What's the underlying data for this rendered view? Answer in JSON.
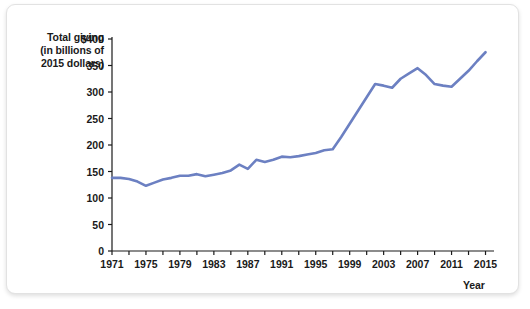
{
  "figure": {
    "y_axis_title_lines": [
      "Total giving",
      "(in billions of",
      "2015 dollars)"
    ],
    "x_axis_title": "Year",
    "line_color": "#6c80c2",
    "axis_color": "#1a1a1a",
    "card_background": "#ffffff"
  },
  "chart_data": {
    "type": "line",
    "title": "",
    "subtitle": "",
    "xlabel": "Year",
    "ylabel": "Total giving (in billions of 2015 dollars)",
    "grid": false,
    "legend": "none",
    "xlim": [
      1971,
      2016
    ],
    "ylim": [
      0,
      400
    ],
    "y_ticks": [
      0,
      50,
      100,
      150,
      200,
      250,
      300,
      350,
      400
    ],
    "y_tick_labels": [
      "0",
      "50",
      "100",
      "150",
      "200",
      "250",
      "300",
      "350",
      "$400"
    ],
    "x_ticks": [
      1971,
      1973,
      1975,
      1977,
      1979,
      1981,
      1983,
      1985,
      1987,
      1989,
      1991,
      1993,
      1995,
      1997,
      1999,
      2001,
      2003,
      2005,
      2007,
      2009,
      2011,
      2013,
      2015
    ],
    "x_tick_labels_shown": [
      "1971",
      "1975",
      "1979",
      "1983",
      "1987",
      "1991",
      "1995",
      "1999",
      "2003",
      "2007",
      "2011",
      "2015"
    ],
    "x": [
      1971,
      1972,
      1973,
      1974,
      1975,
      1976,
      1977,
      1978,
      1979,
      1980,
      1981,
      1982,
      1983,
      1984,
      1985,
      1986,
      1987,
      1988,
      1989,
      1990,
      1991,
      1992,
      1993,
      1994,
      1995,
      1996,
      1997,
      1998,
      1999,
      2000,
      2001,
      2002,
      2003,
      2004,
      2005,
      2006,
      2007,
      2008,
      2009,
      2010,
      2011,
      2012,
      2013,
      2014,
      2015
    ],
    "values": [
      138,
      138,
      136,
      131,
      123,
      129,
      135,
      138,
      142,
      142,
      145,
      141,
      144,
      147,
      152,
      163,
      155,
      172,
      168,
      172,
      178,
      177,
      179,
      182,
      185,
      190,
      192,
      215,
      240,
      265,
      290,
      315,
      312,
      308,
      325,
      335,
      345,
      332,
      315,
      312,
      310,
      325,
      340,
      358,
      375
    ],
    "series": [
      {
        "name": "Total giving",
        "values": [
          138,
          138,
          136,
          131,
          123,
          129,
          135,
          138,
          142,
          142,
          145,
          141,
          144,
          147,
          152,
          163,
          155,
          172,
          168,
          172,
          178,
          177,
          179,
          182,
          185,
          190,
          192,
          215,
          240,
          265,
          290,
          315,
          312,
          308,
          325,
          335,
          345,
          332,
          315,
          312,
          310,
          325,
          340,
          358,
          375
        ]
      }
    ]
  }
}
